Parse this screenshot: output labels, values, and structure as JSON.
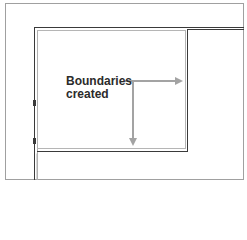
{
  "diagram": {
    "annotation": {
      "line1": "Boundaries",
      "line2": "created"
    },
    "colors": {
      "wall_dark": "#3a3a3a",
      "wall_light": "#b5b5b5",
      "arrow": "#a3a3a3",
      "text": "#2b2b2b",
      "frame": "#9a9a9a"
    }
  }
}
